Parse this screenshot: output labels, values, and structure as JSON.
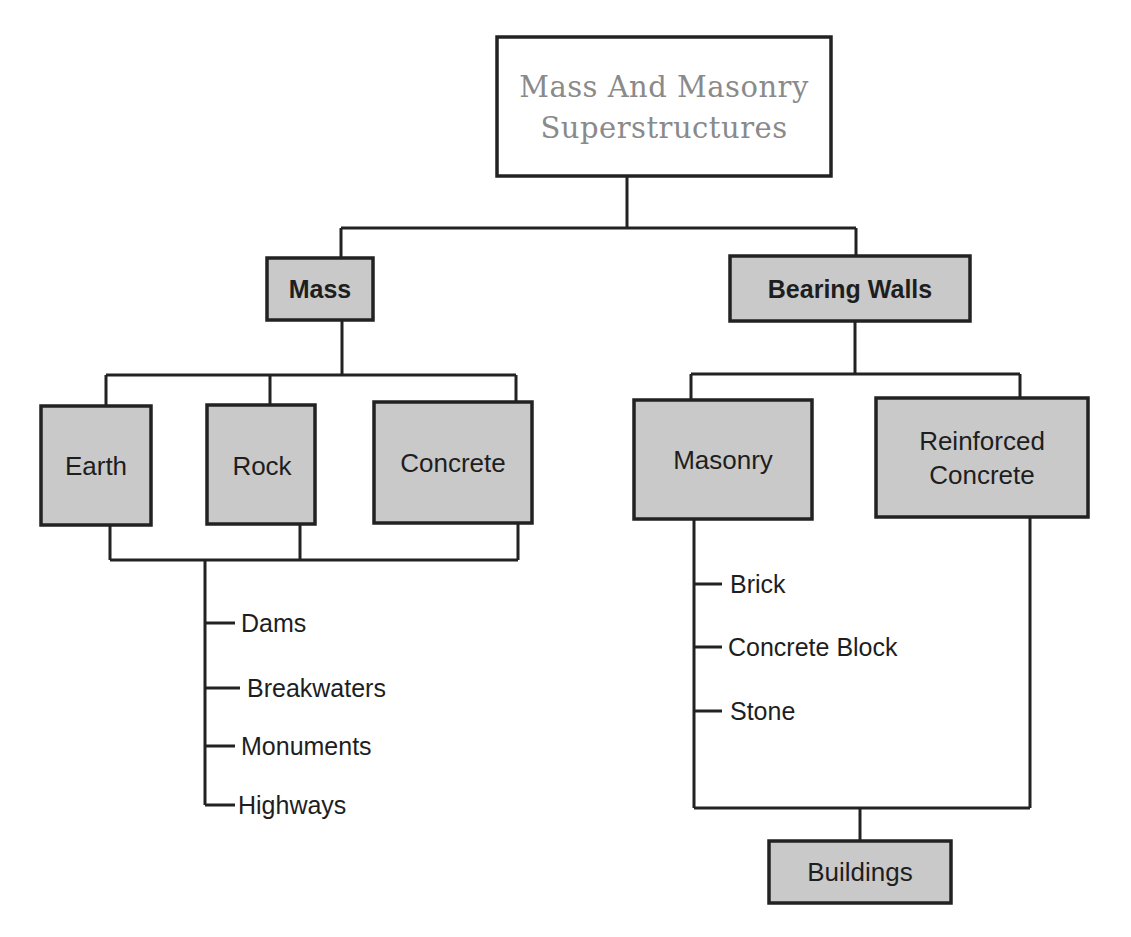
{
  "diagram": {
    "title": {
      "line1": "Mass And Masonry",
      "line2": "Superstructures"
    },
    "colors": {
      "box_fill": "#c9c9c9",
      "title_fill": "#ffffff",
      "stroke": "#222222",
      "title_text": "#8a8a8a",
      "text": "#1e1e1e"
    },
    "level1": {
      "mass": "Mass",
      "bearing_walls": "Bearing Walls"
    },
    "mass_children": [
      "Earth",
      "Rock",
      "Concrete"
    ],
    "mass_uses": [
      "Dams",
      "Breakwaters",
      "Monuments",
      "Highways"
    ],
    "bearing_children": {
      "masonry": "Masonry",
      "reinforced_concrete": {
        "line1": "Reinforced",
        "line2": "Concrete"
      }
    },
    "masonry_types": [
      "Brick",
      "Concrete Block",
      "Stone"
    ],
    "bearing_use": "Buildings"
  }
}
